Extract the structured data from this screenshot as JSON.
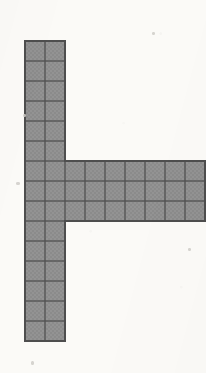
{
  "figure": {
    "shape_name": "capital-F-like right-pointing tee",
    "background_color": "#fbfaf7",
    "cell_fill_color": "#8b8b8b",
    "cell_fill_color_alt": "#949494",
    "grid_line_color": "#585858",
    "outline_color": "#4e4e4e",
    "cell_size_px": 20,
    "origin_x_px": 25,
    "origin_y_px": 41,
    "grid_columns": 9,
    "grid_rows": 15,
    "total_shaded_cells": 51,
    "parts": [
      {
        "name": "vertical-stem",
        "col_start": 0,
        "col_count": 2,
        "row_start": 0,
        "row_count": 15,
        "cells": 30
      },
      {
        "name": "horizontal-arm",
        "col_start": 2,
        "col_count": 7,
        "row_start": 6,
        "row_count": 3,
        "cells": 21
      }
    ],
    "bounds": {
      "left_px": 25,
      "top_px": 41,
      "right_px": 65,
      "bottom_px": 341,
      "arm_right_px": 205,
      "arm_top_px": 161,
      "arm_bottom_px": 221
    },
    "specks": [
      {
        "name": "speck-left-margin",
        "x": 16,
        "y": 182,
        "w": 4,
        "h": 3
      },
      {
        "name": "speck-top-right",
        "x": 152,
        "y": 32,
        "w": 3,
        "h": 3
      },
      {
        "name": "speck-bottom-left",
        "x": 31,
        "y": 361,
        "w": 3,
        "h": 4
      },
      {
        "name": "speck-mid-right",
        "x": 188,
        "y": 248,
        "w": 3,
        "h": 3
      },
      {
        "name": "speck-upper-left",
        "x": 23,
        "y": 114,
        "w": 3,
        "h": 3
      }
    ]
  }
}
